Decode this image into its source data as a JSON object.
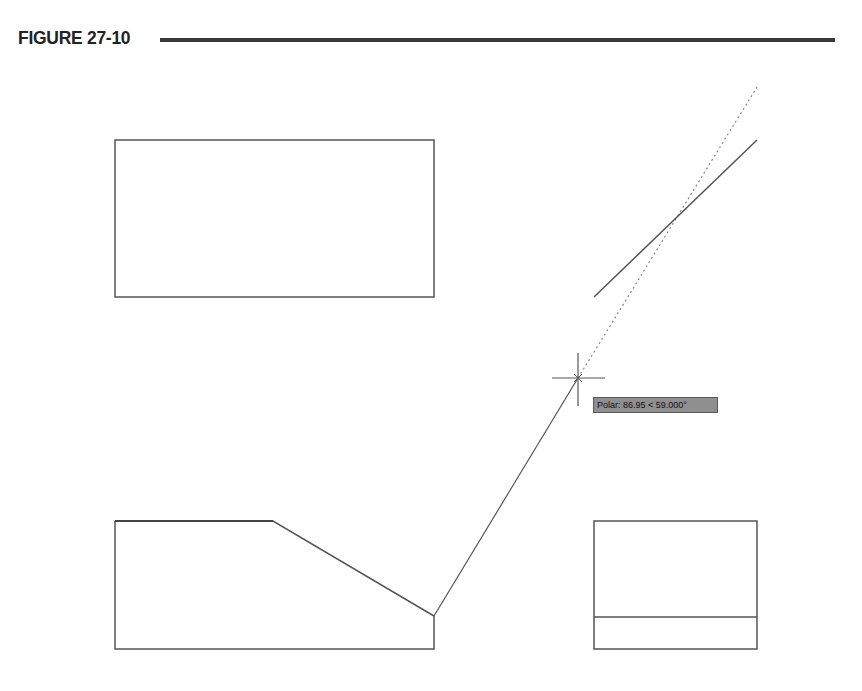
{
  "figure": {
    "title": "FIGURE 27-10"
  },
  "tooltip": {
    "label": "Polar: 86.95 < 59.000°",
    "distance": "86.95",
    "angle": "59.000°"
  },
  "drawing": {
    "stroke_color": "#555555",
    "dotted_color": "#888888",
    "top_rectangle": {
      "x": 115,
      "y": 140,
      "width": 319,
      "height": 157
    },
    "bottom_left_polygon": [
      [
        115,
        521
      ],
      [
        273,
        521
      ],
      [
        434,
        616
      ],
      [
        434,
        649
      ],
      [
        115,
        649
      ]
    ],
    "polar_line": {
      "from": [
        434,
        616
      ],
      "to": [
        578,
        378
      ]
    },
    "tracking_line": {
      "from": [
        578,
        378
      ],
      "to": [
        757,
        87
      ]
    },
    "reference_line": {
      "from": [
        594,
        297
      ],
      "to": [
        757,
        140
      ]
    },
    "crosshair": {
      "center": [
        578,
        378
      ],
      "arm": 26
    },
    "bottom_right_rectangle": {
      "x": 594,
      "y": 521,
      "width": 163,
      "height": 128,
      "divider_y": 617
    }
  }
}
